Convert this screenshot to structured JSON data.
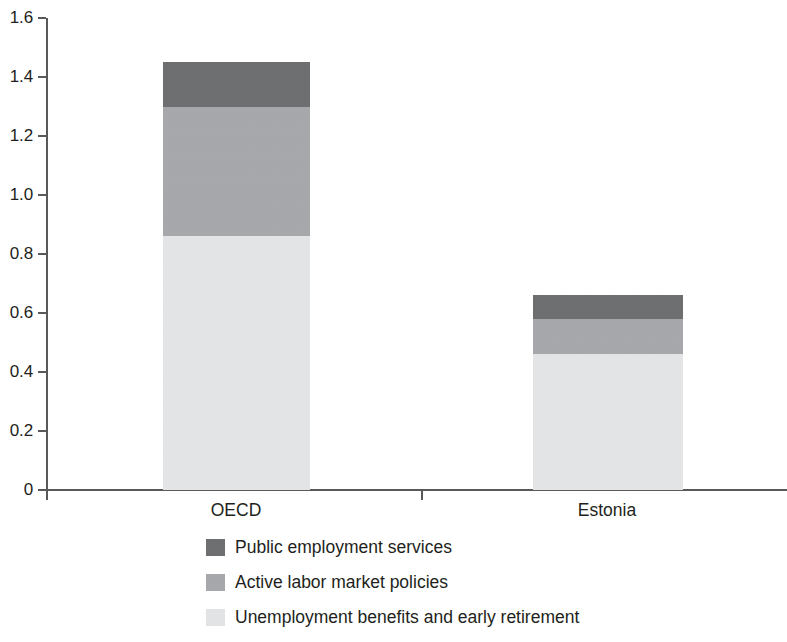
{
  "chart_data": {
    "type": "bar",
    "subtype": "stacked-vertical",
    "title": "",
    "subtitle": "",
    "xlabel": "",
    "ylabel": "",
    "categories": [
      "OECD",
      "Estonia"
    ],
    "series": [
      {
        "name": "Public employment services",
        "color": "#6d6e70",
        "values": [
          0.15,
          0.08
        ]
      },
      {
        "name": "Active labor market policies",
        "color": "#a7a9ac",
        "values": [
          0.44,
          0.12
        ]
      },
      {
        "name": "Unemployment benefits and early retirement",
        "color": "#e6e7e8",
        "values": [
          0.86,
          0.46
        ]
      }
    ],
    "stack_order_bottom_to_top": [
      "Unemployment benefits and early retirement",
      "Active labor market policies",
      "Public employment services"
    ],
    "totals": [
      1.45,
      0.66
    ],
    "ylim": [
      0,
      1.6
    ],
    "ytick_values": [
      0,
      0.2,
      0.4,
      0.6,
      0.8,
      1.0,
      1.2,
      1.4,
      1.6
    ],
    "ytick_labels": [
      "0",
      "0.2",
      "0.4",
      "0.6",
      "0.8",
      "1.0",
      "1.2",
      "1.4",
      "1.6"
    ],
    "grid": false,
    "legend_position": "bottom-center",
    "axis_color": "#58595b",
    "text_color": "#231f20",
    "background": "#ffffff"
  },
  "axes": {
    "y_ticks": [
      {
        "label": "1.6",
        "value": 1.6
      },
      {
        "label": "1.4",
        "value": 1.4
      },
      {
        "label": "1.2",
        "value": 1.2
      },
      {
        "label": "1.0",
        "value": 1.0
      },
      {
        "label": "0.8",
        "value": 0.8
      },
      {
        "label": "0.6",
        "value": 0.6
      },
      {
        "label": "0.4",
        "value": 0.4
      },
      {
        "label": "0.2",
        "value": 0.2
      },
      {
        "label": "0",
        "value": 0
      }
    ],
    "x_categories": [
      {
        "label": "OECD"
      },
      {
        "label": "Estonia"
      }
    ]
  },
  "legend": {
    "items": [
      {
        "label": "Public employment services",
        "color": "#6d6e70"
      },
      {
        "label": "Active labor market policies",
        "color": "#a7a9ac"
      },
      {
        "label": "Unemployment benefits and early retirement",
        "color": "#e6e7e8"
      }
    ]
  }
}
